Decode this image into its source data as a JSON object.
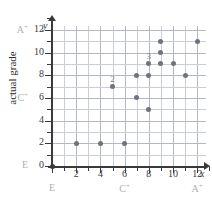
{
  "axes": {
    "x_var": "x",
    "y_var": "y",
    "y_title": "actual grade",
    "x_title": "predicted grade",
    "x_ticks": [
      {
        "value": 2,
        "label": "2"
      },
      {
        "value": 4,
        "label": "4"
      },
      {
        "value": 6,
        "label": "6"
      },
      {
        "value": 8,
        "label": "8"
      },
      {
        "value": 10,
        "label": "10"
      },
      {
        "value": 12,
        "label": "12"
      }
    ],
    "y_ticks": [
      {
        "value": 0,
        "label": "0"
      },
      {
        "value": 2,
        "label": "2"
      },
      {
        "value": 4,
        "label": "4"
      },
      {
        "value": 6,
        "label": "6"
      },
      {
        "value": 8,
        "label": "8"
      },
      {
        "value": 10,
        "label": "10"
      },
      {
        "value": 12,
        "label": "12"
      }
    ],
    "x_grade_labels": [
      {
        "value": 0,
        "label": "E"
      },
      {
        "value": 6,
        "label": "C",
        "sup": "+"
      },
      {
        "value": 12,
        "label": "A",
        "sup": "+"
      }
    ],
    "y_grade_labels": [
      {
        "value": 0,
        "label": "E"
      },
      {
        "value": 6,
        "label": "C",
        "sup": "+"
      },
      {
        "value": 12,
        "label": "A",
        "sup": "+"
      }
    ]
  },
  "chart_data": {
    "type": "scatter",
    "title": "",
    "xlabel": "predicted grade",
    "ylabel": "actual grade",
    "xlim": [
      0,
      13
    ],
    "ylim": [
      0,
      13
    ],
    "grid": true,
    "legend": "none",
    "x_tick_labels": [
      "2",
      "4",
      "6",
      "8",
      "10",
      "12"
    ],
    "y_tick_labels": [
      "0",
      "2",
      "4",
      "6",
      "8",
      "10",
      "12"
    ],
    "x_category_labels": [
      "E",
      "C+",
      "A+"
    ],
    "y_category_labels": [
      "E",
      "C+",
      "A+"
    ],
    "points": [
      {
        "x": 0,
        "y": 0,
        "count": 1,
        "dark": true
      },
      {
        "x": 2,
        "y": 2,
        "count": 1
      },
      {
        "x": 4,
        "y": 2,
        "count": 1
      },
      {
        "x": 6,
        "y": 2,
        "count": 1
      },
      {
        "x": 5,
        "y": 7,
        "count": 2,
        "annotation": "2"
      },
      {
        "x": 7,
        "y": 6,
        "count": 1
      },
      {
        "x": 7,
        "y": 8,
        "count": 1
      },
      {
        "x": 8,
        "y": 5,
        "count": 1
      },
      {
        "x": 8,
        "y": 8,
        "count": 1
      },
      {
        "x": 8,
        "y": 9,
        "count": 3,
        "annotation": "3"
      },
      {
        "x": 9,
        "y": 9,
        "count": 1
      },
      {
        "x": 9,
        "y": 10,
        "count": 1
      },
      {
        "x": 9,
        "y": 11,
        "count": 1
      },
      {
        "x": 10,
        "y": 9,
        "count": 1
      },
      {
        "x": 11,
        "y": 8,
        "count": 1
      },
      {
        "x": 12,
        "y": 11,
        "count": 1
      }
    ],
    "annotations": [
      {
        "text": "2",
        "x": 5,
        "y": 7
      },
      {
        "text": "3",
        "x": 8,
        "y": 9
      }
    ]
  }
}
